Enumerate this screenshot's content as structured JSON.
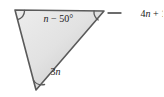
{
  "figure": {
    "kind": "geometry-diagram",
    "shape": "triangle",
    "canvas": {
      "width": 163,
      "height": 97
    },
    "background_color": "#ffffff",
    "fill_color_light": "#e9e9e9",
    "fill_color_dark": "#c6c6c6",
    "stroke_color": "#5a5a5a",
    "text_color": "#1a1a1a"
  },
  "vertices": {
    "top_left": {
      "x": 15,
      "y": 10
    },
    "top_right": {
      "x": 104,
      "y": 11
    },
    "bottom": {
      "x": 36,
      "y": 90
    }
  },
  "angles": [
    {
      "id": "angle-top-left",
      "vertex": "top_left",
      "label": "n − 50°",
      "label_var": "n",
      "label_rest": " − 50°",
      "label_x": 26,
      "label_y": 21,
      "placement": "interior",
      "has_leader": false
    },
    {
      "id": "angle-top-right",
      "vertex": "top_right",
      "label": "4n + 10°",
      "label_prefix": "4",
      "label_var": "n",
      "label_rest": " + 10°",
      "label_x": 122,
      "label_y": 17,
      "placement": "exterior",
      "has_leader": true,
      "leader_from_x": 108,
      "leader_from_y": 13,
      "leader_to_x": 120,
      "leader_to_y": 13
    },
    {
      "id": "angle-bottom",
      "vertex": "bottom",
      "label": "3n",
      "label_prefix": "3",
      "label_var": "n",
      "label_rest": "",
      "label_x": 33,
      "label_y": 74,
      "placement": "interior",
      "has_leader": false
    }
  ]
}
